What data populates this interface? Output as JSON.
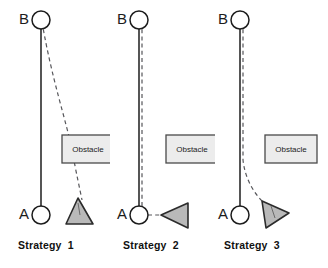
{
  "figure": {
    "background_color": "#ffffff",
    "width": 328,
    "height": 268
  },
  "style": {
    "node_fill": "#ffffff",
    "node_stroke": "#1c1c1c",
    "solid_path_color": "#2b2b2b",
    "dashed_path_color": "#56565a",
    "obstacle_fill": "#ececec",
    "obstacle_stroke": "#4a4a4a",
    "robot_fill": "#b9b9b9",
    "robot_stroke": "#2b2b2b"
  },
  "panels": [
    {
      "id": "strategy-1",
      "caption": "Strategy  1",
      "start_node_label": "A",
      "goal_node_label": "B",
      "obstacle_label": "Obstacle",
      "robot_heading": "up-left",
      "planned_path_note": "straight solid line A to B",
      "executed_path_note": "dashed curve from B bending right around obstacle down to robot near A"
    },
    {
      "id": "strategy-2",
      "caption": "Strategy  2",
      "start_node_label": "A",
      "goal_node_label": "B",
      "obstacle_label": "Obstacle",
      "robot_heading": "left",
      "planned_path_note": "straight solid line A to B",
      "executed_path_note": "dashed line running parallel alongside solid line, robot beside A pointing at it"
    },
    {
      "id": "strategy-3",
      "caption": "Strategy  3",
      "start_node_label": "A",
      "goal_node_label": "B",
      "obstacle_label": "Obstacle",
      "robot_heading": "right",
      "planned_path_note": "straight solid line A to B",
      "executed_path_note": "dashed line follows solid line from B then curves right to robot near A"
    }
  ]
}
